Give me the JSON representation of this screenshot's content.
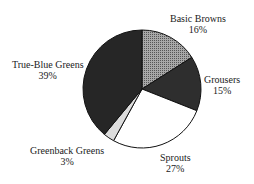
{
  "chart_data": {
    "type": "pie",
    "title": "",
    "slices": [
      {
        "label": "Basic Browns",
        "value": 16,
        "display": "16%",
        "fill": "#8a8a8a"
      },
      {
        "label": "Grousers",
        "value": 15,
        "display": "15%",
        "fill": "#2e2e2e"
      },
      {
        "label": "Sprouts",
        "value": 27,
        "display": "27%",
        "fill": "#ffffff"
      },
      {
        "label": "Greenback Greens",
        "value": 3,
        "display": "3%",
        "fill": "#dcdcdc"
      },
      {
        "label": "True-Blue Greens",
        "value": 39,
        "display": "39%",
        "fill": "#262626"
      }
    ],
    "start_angle_deg": 0,
    "direction": "clockwise"
  },
  "labels": {
    "basic_browns": {
      "name": "Basic Browns",
      "pct": "16%"
    },
    "grousers": {
      "name": "Grousers",
      "pct": "15%"
    },
    "sprouts": {
      "name": "Sprouts",
      "pct": "27%"
    },
    "greenback": {
      "name": "Greenback Greens",
      "pct": "3%"
    },
    "trueblue": {
      "name": "True-Blue Greens",
      "pct": "39%"
    }
  }
}
